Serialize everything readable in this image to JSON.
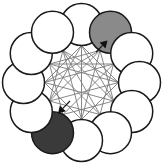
{
  "figure": {
    "type": "diagram",
    "width": 163,
    "height": 165,
    "background_color": "#ffffff"
  },
  "geometry": {
    "center_x": 81.5,
    "center_y": 82.5,
    "ring_radius": 58,
    "node_radius": 21,
    "node_count": 12,
    "start_angle_deg": -90,
    "inner_polygon_radius": 37
  },
  "colors": {
    "node_outline": "#1a1a1a",
    "node_white": "#ffffff",
    "node_gray": "#8a8a8a",
    "node_dark": "#3a3a3a",
    "chord_line": "#7a7a7a",
    "arrow": "#111111"
  },
  "nodes": [
    {
      "id": "n1",
      "index": 0,
      "position": "top",
      "angle_deg": -90,
      "fill": "#ffffff",
      "shade": "white",
      "label": ""
    },
    {
      "id": "n2",
      "index": 1,
      "position": "top-right",
      "angle_deg": -60,
      "fill": "#8a8a8a",
      "shade": "gray",
      "label": ""
    },
    {
      "id": "n3",
      "index": 2,
      "position": "upper-right",
      "angle_deg": -30,
      "fill": "#ffffff",
      "shade": "white",
      "label": ""
    },
    {
      "id": "n4",
      "index": 3,
      "position": "right",
      "angle_deg": 0,
      "fill": "#ffffff",
      "shade": "white",
      "label": ""
    },
    {
      "id": "n5",
      "index": 4,
      "position": "lower-right",
      "angle_deg": 30,
      "fill": "#ffffff",
      "shade": "white",
      "label": ""
    },
    {
      "id": "n6",
      "index": 5,
      "position": "bottom-right",
      "angle_deg": 60,
      "fill": "#ffffff",
      "shade": "white",
      "label": ""
    },
    {
      "id": "n7",
      "index": 6,
      "position": "bottom",
      "angle_deg": 90,
      "fill": "#ffffff",
      "shade": "white",
      "label": ""
    },
    {
      "id": "n8",
      "index": 7,
      "position": "bottom-left",
      "angle_deg": 120,
      "fill": "#3a3a3a",
      "shade": "dark",
      "label": ""
    },
    {
      "id": "n9",
      "index": 8,
      "position": "lower-left",
      "angle_deg": 150,
      "fill": "#ffffff",
      "shade": "white",
      "label": ""
    },
    {
      "id": "n10",
      "index": 9,
      "position": "left",
      "angle_deg": 180,
      "fill": "#ffffff",
      "shade": "white",
      "label": ""
    },
    {
      "id": "n11",
      "index": 10,
      "position": "upper-left",
      "angle_deg": 210,
      "fill": "#ffffff",
      "shade": "white",
      "label": ""
    },
    {
      "id": "n12",
      "index": 11,
      "position": "top-left",
      "angle_deg": 240,
      "fill": "#ffffff",
      "shade": "white",
      "label": ""
    }
  ],
  "chords": [
    {
      "from": 0,
      "to": 3
    },
    {
      "from": 0,
      "to": 4
    },
    {
      "from": 0,
      "to": 6
    },
    {
      "from": 0,
      "to": 8
    },
    {
      "from": 0,
      "to": 9
    },
    {
      "from": 1,
      "to": 4
    },
    {
      "from": 1,
      "to": 6
    },
    {
      "from": 1,
      "to": 8
    },
    {
      "from": 1,
      "to": 9
    },
    {
      "from": 1,
      "to": 10
    },
    {
      "from": 2,
      "to": 5
    },
    {
      "from": 2,
      "to": 7
    },
    {
      "from": 2,
      "to": 9
    },
    {
      "from": 2,
      "to": 10
    },
    {
      "from": 3,
      "to": 6
    },
    {
      "from": 3,
      "to": 8
    },
    {
      "from": 3,
      "to": 10
    },
    {
      "from": 3,
      "to": 11
    },
    {
      "from": 4,
      "to": 7
    },
    {
      "from": 4,
      "to": 9
    },
    {
      "from": 4,
      "to": 11
    },
    {
      "from": 5,
      "to": 8
    },
    {
      "from": 5,
      "to": 10
    },
    {
      "from": 5,
      "to": 11
    },
    {
      "from": 6,
      "to": 9
    },
    {
      "from": 6,
      "to": 11
    },
    {
      "from": 7,
      "to": 10
    },
    {
      "from": 8,
      "to": 11
    }
  ],
  "arrows": [
    {
      "id": "arrow-to-gray-node",
      "target_node": "n2",
      "target_position": "top-right",
      "direction": "up-right",
      "x1": 96.0,
      "y1": 52.0,
      "x2": 107.5,
      "y2": 40.5
    },
    {
      "id": "arrow-to-dark-node",
      "target_node": "n8",
      "target_position": "bottom-left",
      "direction": "down-left",
      "x1": 70.0,
      "y1": 101.0,
      "x2": 58.0,
      "y2": 113.5
    }
  ]
}
